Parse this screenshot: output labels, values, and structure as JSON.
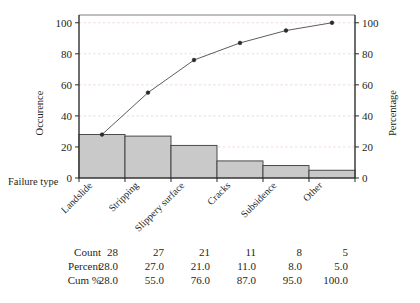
{
  "chart_data": {
    "type": "bar",
    "title": "",
    "subtitle": "",
    "categories": [
      "Landslide",
      "Stripping",
      "Slippery surface",
      "Cracks",
      "Subsidence",
      "Other"
    ],
    "series": [
      {
        "name": "Count",
        "type": "bar",
        "values": [
          28,
          27,
          21,
          11,
          8,
          5
        ]
      },
      {
        "name": "Cum %",
        "type": "line",
        "values": [
          28.0,
          55.0,
          76.0,
          87.0,
          95.0,
          100.0
        ]
      }
    ],
    "values": [
      28,
      27,
      21,
      11,
      8,
      5
    ],
    "xlabel": "Failure type",
    "ylabel": "Occurence",
    "y2label": "Percentage",
    "ylim": [
      0,
      105
    ],
    "y2lim": [
      0,
      105
    ],
    "yticks": [
      0,
      20,
      40,
      60,
      80,
      100
    ],
    "y2ticks": [
      0,
      20,
      40,
      60,
      80,
      100
    ],
    "ytick_labels": [
      "0",
      "20",
      "40",
      "60",
      "80",
      "100"
    ],
    "y2tick_labels": [
      "0",
      "20",
      "40",
      "60",
      "80",
      "100"
    ],
    "grid": true,
    "legend": "none",
    "colors": {
      "bar_fill": "#c9c9c9",
      "bar_stroke": "#3a3a3a",
      "line": "#4a4a4a",
      "marker": "#2a2a2a",
      "grid": "#e8c9c9",
      "axis": "#2b2b2b",
      "frame": "#6f6f6f",
      "text": "#231f20"
    }
  },
  "axes": {
    "left_title": "Occurence",
    "right_title": "Percentage",
    "x_title": "Failure type"
  },
  "table": {
    "row_labels": [
      "Count",
      "Percent",
      "Cum %"
    ],
    "rows": [
      {
        "label": "Count",
        "values": [
          "28",
          "27",
          "21",
          "11",
          "8",
          "5"
        ]
      },
      {
        "label": "Percent",
        "values": [
          "28.0",
          "27.0",
          "21.0",
          "11.0",
          "8.0",
          "5.0"
        ]
      },
      {
        "label": "Cum %",
        "values": [
          "28.0",
          "55.0",
          "76.0",
          "87.0",
          "95.0",
          "100.0"
        ]
      }
    ]
  }
}
